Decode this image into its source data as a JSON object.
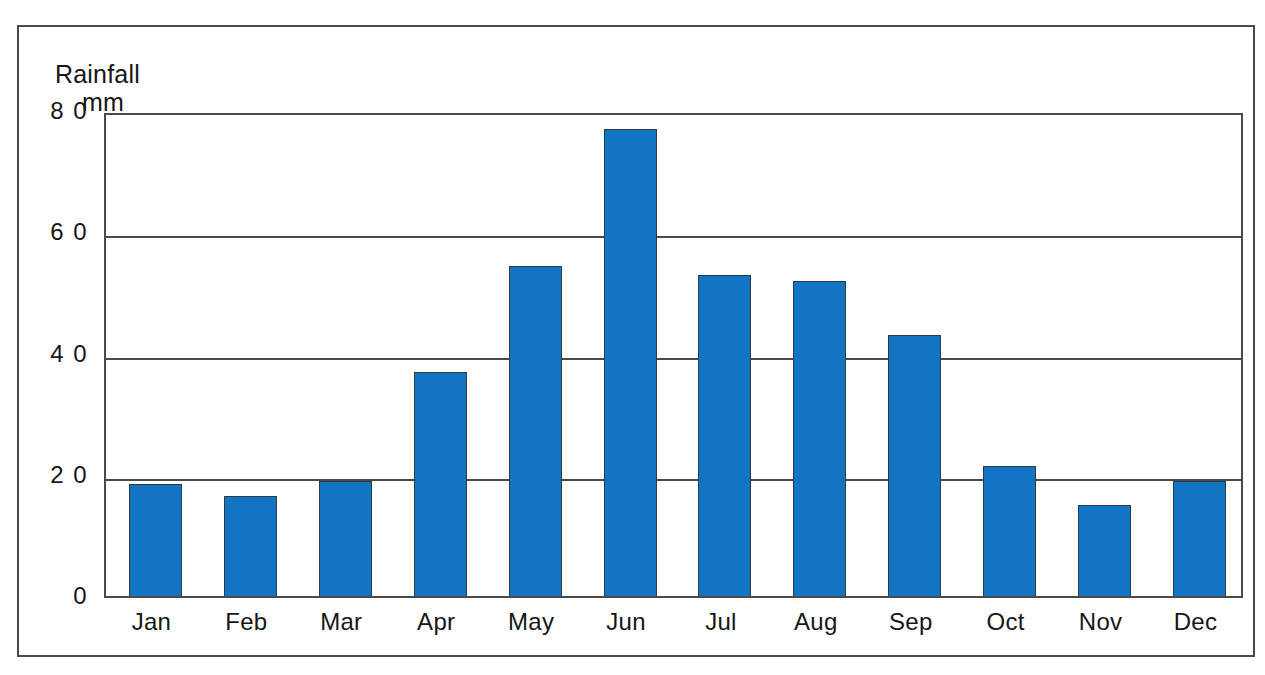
{
  "chart_data": {
    "type": "bar",
    "title": "Rainfall mm",
    "title_lines": [
      "Rainfall",
      "mm"
    ],
    "xlabel": "",
    "ylabel": "Rainfall mm",
    "categories": [
      "Jan",
      "Feb",
      "Mar",
      "Apr",
      "May",
      "Jun",
      "Jul",
      "Aug",
      "Sep",
      "Oct",
      "Nov",
      "Dec"
    ],
    "values": [
      18.5,
      16.5,
      19,
      37,
      54.5,
      77,
      53,
      52,
      43,
      21.5,
      15,
      19
    ],
    "ylim": [
      0,
      80
    ],
    "yticks": [
      0,
      20,
      40,
      60,
      80
    ],
    "ytick_labels": [
      "0",
      "2 0",
      "4 0",
      "6 0",
      "8 0"
    ],
    "grid": true,
    "grid_axis": "y",
    "legend": false,
    "bar_color": "#1474c4",
    "bar_edge_color": "#2b3b4a",
    "axis_color": "#4a4a4a",
    "background_color": "#ffffff",
    "text_color": "#161616"
  }
}
